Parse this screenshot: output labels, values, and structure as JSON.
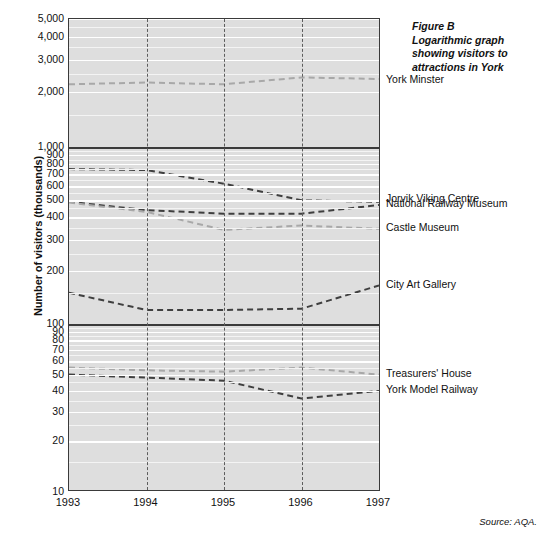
{
  "figure": {
    "caption_lines": [
      "Figure B",
      "Logarithmic graph",
      "showing visitors to",
      "attractions in York"
    ],
    "source_note": "Source: AQA.",
    "y_axis_title": "Number of visitors (thousands)"
  },
  "axis": {
    "x_ticks": [
      "1993",
      "1994",
      "1995",
      "1996",
      "1997"
    ],
    "y_ticks_top": [
      "5,000",
      "4,000",
      "3,000",
      "2,000"
    ],
    "y_ticks_mid": [
      "1,000",
      "900",
      "800",
      "700",
      "600",
      "500",
      "400",
      "300",
      "200"
    ],
    "y_ticks_bottom": [
      "100",
      "90",
      "80",
      "70",
      "60",
      "50",
      "40",
      "30",
      "20",
      "10"
    ]
  },
  "series_labels": {
    "york_minster": "York Minster",
    "jorvik": "Jorvik Viking Centre",
    "national_railway": "National Railway Museum",
    "castle_museum": "Castle Museum",
    "city_art_gallery": "City Art Gallery",
    "treasurers_house": "Treasurers' House",
    "york_model_railway": "York Model Railway"
  },
  "colors": {
    "plot_background": "#dedede",
    "axis": "#3a3a3a",
    "gridline": "#f4f4f4",
    "dark_series": "#3f3f3f",
    "light_series": "#a8a8a8",
    "text": "#111111"
  },
  "chart_data": {
    "type": "line",
    "xlabel": "",
    "ylabel": "Number of visitors (thousands)",
    "scale": "log",
    "grid": true,
    "legend": "right-inline-labels",
    "ylim": [
      10,
      5000
    ],
    "x": [
      1993,
      1994,
      1995,
      1996,
      1997
    ],
    "categories": [
      "1993",
      "1994",
      "1995",
      "1996",
      "1997"
    ],
    "series": [
      {
        "name": "York Minster",
        "values": [
          2200,
          2250,
          2200,
          2400,
          2350
        ],
        "style": "dashed",
        "color": "#a8a8a8"
      },
      {
        "name": "Jorvik Viking Centre",
        "values": [
          750,
          740,
          620,
          500,
          490
        ],
        "style": "dashed",
        "color": "#3f3f3f"
      },
      {
        "name": "National Railway Museum",
        "values": [
          490,
          440,
          420,
          420,
          470
        ],
        "style": "dashed",
        "color": "#3f3f3f"
      },
      {
        "name": "Castle Museum",
        "values": [
          485,
          430,
          340,
          360,
          345
        ],
        "style": "dashed",
        "color": "#a8a8a8"
      },
      {
        "name": "City Art Gallery",
        "values": [
          150,
          120,
          120,
          122,
          165
        ],
        "style": "dashed",
        "color": "#3f3f3f"
      },
      {
        "name": "Treasurers' House",
        "values": [
          55,
          53,
          52,
          55,
          50
        ],
        "style": "dashed",
        "color": "#a8a8a8"
      },
      {
        "name": "York Model Railway",
        "values": [
          50,
          48,
          46,
          36,
          40
        ],
        "style": "dashed",
        "color": "#3f3f3f"
      }
    ]
  }
}
